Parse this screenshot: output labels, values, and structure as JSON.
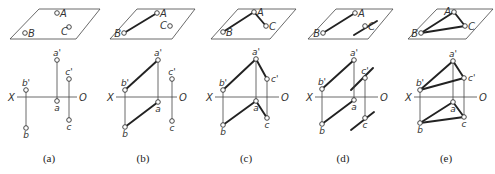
{
  "figure": {
    "panels": [
      {
        "id": "a",
        "caption": "(a)",
        "plane": {
          "top": [
            [
              39,
              9
            ],
            [
              100,
              9
            ]
          ],
          "bottom": [
            [
              10,
              39
            ],
            [
              76,
              39
            ]
          ]
        },
        "space_points": {
          "A": [
            57,
            13
          ],
          "B": [
            25,
            33
          ],
          "C": [
            69,
            27
          ]
        },
        "space_labels": {
          "A": "A",
          "B": "B",
          "C": "C"
        },
        "space_segments": [],
        "axis": {
          "y": 97,
          "x1": 17,
          "x2": 77,
          "x_label": "X",
          "o_label": "O",
          "x_label_pos": [
            8,
            101
          ],
          "o_label_pos": [
            79,
            101
          ]
        },
        "proj_points": {
          "a1": [
            57,
            60
          ],
          "a": [
            57,
            101
          ],
          "b1": [
            26,
            90
          ],
          "b": [
            26,
            128
          ],
          "c1": [
            69,
            79
          ],
          "c": [
            69,
            120
          ]
        },
        "proj_labels": {
          "a1": "a'",
          "a": "a",
          "b1": "b'",
          "b": "b",
          "c1": "c'",
          "c": "c"
        },
        "proj_segments": [],
        "aux_lines": []
      },
      {
        "id": "b",
        "caption": "(b)",
        "plane": {
          "top": [
            [
              137,
              9
            ],
            [
              195,
              9
            ]
          ],
          "bottom": [
            [
              110,
              39
            ],
            [
              172,
              39
            ]
          ]
        },
        "space_points": {
          "A": [
            157,
            13
          ],
          "B": [
            124,
            33
          ],
          "C": [
            170,
            26
          ]
        },
        "space_labels": {
          "A": "A",
          "B": "B",
          "C": "C"
        },
        "space_segments": [
          [
            "A",
            "B"
          ]
        ],
        "axis": {
          "y": 97,
          "x1": 116,
          "x2": 177,
          "x_label": "X",
          "o_label": "O",
          "x_label_pos": [
            107,
            101
          ],
          "o_label_pos": [
            179,
            101
          ]
        },
        "proj_points": {
          "a1": [
            158,
            60
          ],
          "a": [
            158,
            102
          ],
          "b1": [
            125,
            90
          ],
          "b": [
            125,
            127
          ],
          "c1": [
            172,
            79
          ],
          "c": [
            172,
            121
          ]
        },
        "proj_labels": {
          "a1": "a'",
          "a": "a",
          "b1": "b'",
          "b": "b",
          "c1": "c'",
          "c": "c"
        },
        "proj_segments": [
          [
            "a1",
            "b1"
          ],
          [
            "a",
            "b"
          ]
        ],
        "aux_lines": []
      },
      {
        "id": "c",
        "caption": "(c)",
        "plane": {
          "top": [
            [
              238,
              9
            ],
            [
              296,
              9
            ]
          ],
          "bottom": [
            [
              211,
              39
            ],
            [
              270,
              39
            ]
          ]
        },
        "space_points": {
          "A": [
            254,
            12
          ],
          "B": [
            223,
            32
          ],
          "C": [
            266,
            26
          ]
        },
        "space_labels": {
          "A": "A",
          "B": "B",
          "C": "C"
        },
        "space_segments": [
          [
            "A",
            "B"
          ],
          [
            "A",
            "C"
          ]
        ],
        "axis": {
          "y": 97,
          "x1": 215,
          "x2": 279,
          "x_label": "X",
          "o_label": "O",
          "x_label_pos": [
            206,
            101
          ],
          "o_label_pos": [
            281,
            101
          ]
        },
        "proj_points": {
          "a1": [
            256,
            59
          ],
          "a": [
            256,
            101
          ],
          "b1": [
            223,
            90
          ],
          "b": [
            223,
            125
          ],
          "c1": [
            267,
            79
          ],
          "c": [
            267,
            118
          ]
        },
        "proj_labels": {
          "a1": "a'",
          "a": "a",
          "b1": "b'",
          "b": "b",
          "c1": "c'",
          "c": "c"
        },
        "proj_segments": [
          [
            "a1",
            "b1"
          ],
          [
            "a1",
            "c1"
          ],
          [
            "a",
            "b"
          ],
          [
            "a",
            "c"
          ]
        ],
        "aux_lines": []
      },
      {
        "id": "d",
        "caption": "(d)",
        "plane": {
          "top": [
            [
              336,
              9
            ],
            [
              393,
              9
            ]
          ],
          "bottom": [
            [
              308,
              39
            ],
            [
              368,
              39
            ]
          ]
        },
        "space_points": {
          "A": [
            355,
            13
          ],
          "B": [
            323,
            33
          ],
          "C": [
            365,
            26
          ]
        },
        "space_labels": {
          "A": "A",
          "B": "B",
          "C": "C"
        },
        "space_segments": [
          [
            "A",
            "B"
          ]
        ],
        "axis": {
          "y": 97,
          "x1": 315,
          "x2": 378,
          "x_label": "X",
          "o_label": "O",
          "x_label_pos": [
            306,
            101
          ],
          "o_label_pos": [
            380,
            101
          ]
        },
        "proj_points": {
          "a1": [
            354,
            60
          ],
          "a": [
            354,
            100
          ],
          "b1": [
            322,
            89
          ],
          "b": [
            322,
            124
          ],
          "c1": [
            365,
            78
          ],
          "c": [
            365,
            118
          ]
        },
        "proj_labels": {
          "a1": "a'",
          "a": "a",
          "b1": "b'",
          "b": "b",
          "c1": "c'",
          "c": "c"
        },
        "proj_segments": [
          [
            "a1",
            "b1"
          ],
          [
            "a",
            "b"
          ]
        ],
        "aux_lines": [
          [
            [
              354,
              35
            ],
            [
              377,
              21
            ]
          ],
          [
            [
              351,
              90
            ],
            [
              373,
              68
            ]
          ],
          [
            [
              351,
              130
            ],
            [
              374,
              112
            ]
          ]
        ]
      },
      {
        "id": "e",
        "caption": "(e)",
        "plane": {
          "top": [
            [
              437,
              9
            ],
            [
              493,
              9
            ]
          ],
          "bottom": [
            [
              408,
              39
            ],
            [
              466,
              39
            ]
          ]
        },
        "space_points": {
          "A": [
            454,
            12
          ],
          "B": [
            421,
            33
          ],
          "C": [
            465,
            26
          ]
        },
        "space_labels": {
          "A": "A",
          "B": "B",
          "C": "C"
        },
        "space_segments": [
          [
            "A",
            "B"
          ],
          [
            "A",
            "C"
          ],
          [
            "B",
            "C"
          ]
        ],
        "axis": {
          "y": 97,
          "x1": 414,
          "x2": 477,
          "x_label": "X",
          "o_label": "O",
          "x_label_pos": [
            405,
            101
          ],
          "o_label_pos": [
            479,
            101
          ]
        },
        "proj_points": {
          "a1": [
            453,
            61
          ],
          "a": [
            453,
            102
          ],
          "b1": [
            420,
            90
          ],
          "b": [
            420,
            123
          ],
          "c1": [
            464,
            78
          ],
          "c": [
            464,
            117
          ]
        },
        "proj_labels": {
          "a1": "a'",
          "a": "a",
          "b1": "b'",
          "b": "b",
          "c1": "c'",
          "c": "c"
        },
        "proj_segments": [
          [
            "a1",
            "b1"
          ],
          [
            "a1",
            "c1"
          ],
          [
            "b1",
            "c1"
          ],
          [
            "a",
            "b"
          ],
          [
            "a",
            "c"
          ],
          [
            "b",
            "c"
          ]
        ],
        "aux_lines": []
      }
    ],
    "caption_positions": [
      [
        49,
        162
      ],
      [
        143,
        162
      ],
      [
        246,
        162
      ],
      [
        343,
        162
      ],
      [
        446,
        162
      ]
    ]
  }
}
